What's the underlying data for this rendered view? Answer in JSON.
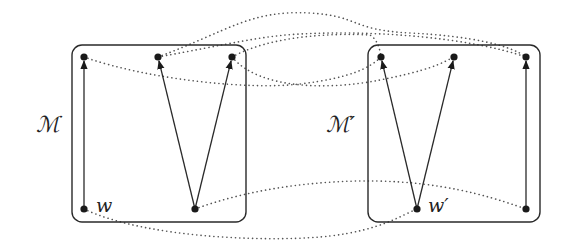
{
  "diagram": {
    "type": "bisimulation-of-kripke-models",
    "colors": {
      "stroke": "#2a2a2a",
      "node": "#1a1a1a",
      "dotted": "#555555",
      "background": "#ffffff"
    },
    "models": [
      {
        "id": "M",
        "label": "ℳ",
        "box": {
          "x": 72,
          "y": 45,
          "w": 174,
          "h": 177,
          "r": 10
        },
        "label_pos": {
          "x": 36,
          "y": 128
        },
        "nodes": [
          {
            "id": "m_tl",
            "x": 84,
            "y": 57
          },
          {
            "id": "m_tm",
            "x": 158,
            "y": 57
          },
          {
            "id": "m_tr",
            "x": 232,
            "y": 57
          },
          {
            "id": "w",
            "x": 84,
            "y": 209,
            "label": "w"
          },
          {
            "id": "m_bm",
            "x": 195,
            "y": 209
          }
        ],
        "edges": [
          {
            "from": "w",
            "to": "m_tl"
          },
          {
            "from": "m_bm",
            "to": "m_tm"
          },
          {
            "from": "m_bm",
            "to": "m_tr"
          }
        ]
      },
      {
        "id": "M'",
        "label": "ℳ′",
        "box": {
          "x": 368,
          "y": 45,
          "w": 172,
          "h": 177,
          "r": 10
        },
        "label_pos": {
          "x": 326,
          "y": 128
        },
        "nodes": [
          {
            "id": "n_tl",
            "x": 381,
            "y": 57
          },
          {
            "id": "n_tm",
            "x": 454,
            "y": 57
          },
          {
            "id": "n_tr",
            "x": 526,
            "y": 57
          },
          {
            "id": "w_prime",
            "x": 417,
            "y": 209,
            "label": "w′"
          },
          {
            "id": "n_br",
            "x": 526,
            "y": 209
          }
        ],
        "edges": [
          {
            "from": "w_prime",
            "to": "n_tl"
          },
          {
            "from": "w_prime",
            "to": "n_tm"
          },
          {
            "from": "n_br",
            "to": "n_tr"
          }
        ]
      }
    ],
    "labels": {
      "model_left": "ℳ",
      "model_right": "ℳ′",
      "world_left": "w",
      "world_right": "w′"
    },
    "relations": [
      {
        "from": "m_tl",
        "to": "n_tl",
        "path": "M 84 57 C 150 80, 250 90, 300 84 S 370 68, 381 57"
      },
      {
        "from": "m_tr",
        "to": "n_tm",
        "path": "M 232 57 C 260 90, 330 90, 380 80 S 440 64, 454 57"
      },
      {
        "from": "m_tm",
        "to": "n_tr",
        "path": "M 158 57 C 230 30, 250 10, 310 13 C 360 16, 350 30, 410 33 C 470 36, 510 45, 526 57"
      },
      {
        "from": "m_tr",
        "to": "n_tl",
        "path": "M 232 57 C 270 36, 330 33, 370 35 C 378 40, 380 50, 381 57"
      },
      {
        "from": "m_tm",
        "to": "n_tr",
        "path": "M 158 57 C 230 44, 260 36, 300 34 C 380 30, 470 38, 526 57"
      },
      {
        "from": "w",
        "to": "w_prime",
        "path": "M 84 209 C 150 240, 280 242, 330 236 C 380 230, 400 216, 417 209"
      },
      {
        "from": "m_bm",
        "to": "n_br",
        "path": "M 195 209 C 260 185, 340 178, 400 182 C 460 186, 500 200, 526 209"
      }
    ]
  }
}
